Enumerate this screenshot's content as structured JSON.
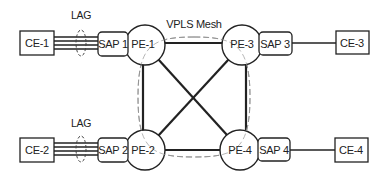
{
  "diagram": {
    "title": "VPLS Mesh",
    "colors": {
      "stroke": "#222222",
      "dash": "#888888",
      "background": "#ffffff"
    },
    "lag_labels": [
      "LAG",
      "LAG"
    ],
    "ce_nodes": [
      {
        "id": "ce1",
        "label": "CE-1"
      },
      {
        "id": "ce2",
        "label": "CE-2"
      },
      {
        "id": "ce3",
        "label": "CE-3"
      },
      {
        "id": "ce4",
        "label": "CE-4"
      }
    ],
    "sap_nodes": [
      {
        "id": "sap1",
        "label": "SAP 1"
      },
      {
        "id": "sap2",
        "label": "SAP 2"
      },
      {
        "id": "sap3",
        "label": "SAP 3"
      },
      {
        "id": "sap4",
        "label": "SAP 4"
      }
    ],
    "pe_nodes": [
      {
        "id": "pe1",
        "label": "PE-1"
      },
      {
        "id": "pe2",
        "label": "PE-2"
      },
      {
        "id": "pe3",
        "label": "PE-3"
      },
      {
        "id": "pe4",
        "label": "PE-4"
      }
    ],
    "links": [
      {
        "from": "CE-1",
        "to": "SAP 1",
        "type": "LAG",
        "members": 4
      },
      {
        "from": "CE-2",
        "to": "SAP 2",
        "type": "LAG",
        "members": 4
      },
      {
        "from": "SAP 3",
        "to": "CE-3",
        "type": "single"
      },
      {
        "from": "SAP 4",
        "to": "CE-4",
        "type": "single"
      },
      {
        "from": "PE-1",
        "to": "PE-3",
        "type": "mesh"
      },
      {
        "from": "PE-1",
        "to": "PE-2",
        "type": "mesh"
      },
      {
        "from": "PE-3",
        "to": "PE-4",
        "type": "mesh"
      },
      {
        "from": "PE-2",
        "to": "PE-4",
        "type": "mesh"
      },
      {
        "from": "PE-1",
        "to": "PE-4",
        "type": "mesh"
      },
      {
        "from": "PE-3",
        "to": "PE-2",
        "type": "mesh"
      }
    ]
  }
}
